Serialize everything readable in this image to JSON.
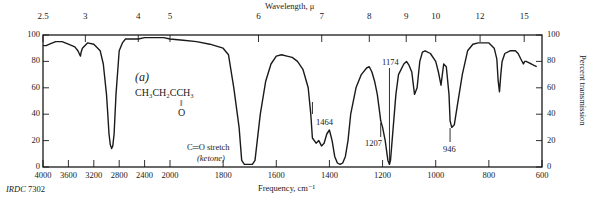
{
  "chart_data": {
    "type": "line",
    "panel_label": "(a)",
    "compound": {
      "formula_line": "CH3CH2CCH3",
      "formula_display": "CH₃CH₂CCH₃",
      "carbonyl_bond": "‖",
      "carbonyl_atom": "O"
    },
    "top_axis": {
      "label": "Wavelength, μ",
      "ticks": [
        {
          "label": "2.5",
          "wavenumber": 4000
        },
        {
          "label": "3",
          "wavenumber": 3333
        },
        {
          "label": "4",
          "wavenumber": 2500
        },
        {
          "label": "5",
          "wavenumber": 2000
        },
        {
          "label": "6",
          "wavenumber": 1667
        },
        {
          "label": "7",
          "wavenumber": 1429
        },
        {
          "label": "8",
          "wavenumber": 1250
        },
        {
          "label": "9",
          "wavenumber": 1111
        },
        {
          "label": "10",
          "wavenumber": 1000
        },
        {
          "label": "12",
          "wavenumber": 833
        },
        {
          "label": "15",
          "wavenumber": 667
        }
      ]
    },
    "xlabel": "Frequency, cm⁻¹",
    "x_ticks": [
      4000,
      3600,
      3200,
      2800,
      2400,
      2000,
      1800,
      1600,
      1400,
      1200,
      1000,
      800,
      600
    ],
    "xlim": [
      4000,
      600
    ],
    "x_scale_note": "scale expands 2x below 2000 cm-1",
    "ylabel": "Percent transmission",
    "y_ticks": [
      0,
      20,
      40,
      60,
      80,
      100
    ],
    "ylim": [
      0,
      100
    ],
    "grid": false,
    "series": [
      {
        "name": "2-butanone",
        "x": [
          4000,
          3950,
          3900,
          3800,
          3700,
          3600,
          3500,
          3450,
          3420,
          3410,
          3400,
          3380,
          3300,
          3200,
          3100,
          3050,
          3000,
          2980,
          2960,
          2940,
          2920,
          2900,
          2880,
          2850,
          2800,
          2750,
          2700,
          2600,
          2500,
          2400,
          2300,
          2200,
          2100,
          2000,
          1950,
          1900,
          1850,
          1800,
          1780,
          1760,
          1740,
          1730,
          1720,
          1710,
          1700,
          1690,
          1680,
          1660,
          1640,
          1620,
          1600,
          1580,
          1560,
          1540,
          1520,
          1500,
          1480,
          1470,
          1464,
          1450,
          1440,
          1430,
          1420,
          1410,
          1400,
          1390,
          1380,
          1370,
          1360,
          1350,
          1340,
          1330,
          1320,
          1300,
          1280,
          1260,
          1250,
          1240,
          1230,
          1220,
          1210,
          1207,
          1200,
          1190,
          1180,
          1174,
          1170,
          1160,
          1150,
          1140,
          1120,
          1110,
          1100,
          1090,
          1080,
          1070,
          1060,
          1050,
          1040,
          1020,
          1000,
          990,
          980,
          970,
          960,
          950,
          946,
          940,
          930,
          920,
          900,
          880,
          860,
          840,
          820,
          800,
          780,
          770,
          765,
          760,
          755,
          750,
          740,
          720,
          700,
          690,
          680,
          670,
          665,
          660,
          650,
          640,
          630,
          620
        ],
        "y": [
          92,
          92,
          93,
          95,
          95,
          93,
          91,
          88,
          85,
          84,
          87,
          90,
          94,
          93,
          88,
          78,
          55,
          40,
          25,
          17,
          14,
          16,
          25,
          55,
          88,
          94,
          97,
          97,
          97,
          98,
          98,
          98,
          98,
          97,
          96,
          95,
          93,
          90,
          85,
          60,
          30,
          5,
          2,
          2,
          2,
          2,
          5,
          40,
          65,
          78,
          84,
          85,
          84,
          83,
          80,
          74,
          60,
          40,
          22,
          18,
          20,
          16,
          18,
          25,
          28,
          20,
          8,
          3,
          2,
          3,
          8,
          20,
          40,
          60,
          70,
          75,
          76,
          72,
          65,
          55,
          40,
          35,
          30,
          20,
          5,
          2,
          5,
          30,
          55,
          70,
          78,
          80,
          77,
          72,
          55,
          60,
          80,
          87,
          88,
          86,
          80,
          72,
          62,
          78,
          76,
          55,
          35,
          30,
          32,
          45,
          70,
          88,
          93,
          94,
          94,
          94,
          90,
          82,
          65,
          57,
          70,
          80,
          86,
          88,
          88,
          86,
          82,
          78,
          80,
          80,
          79,
          78,
          77,
          76
        ]
      }
    ],
    "annotations": [
      {
        "text": "C=O stretch",
        "sub": "(ketone)",
        "wavenumber": 1715
      },
      {
        "text": "1464",
        "wavenumber": 1464
      },
      {
        "text": "1207",
        "wavenumber": 1207
      },
      {
        "text": "1174",
        "wavenumber": 1174
      },
      {
        "text": "946",
        "wavenumber": 946
      }
    ],
    "footer_label": "IRDC 7302",
    "colors": {
      "ink": "#1a1a1a",
      "background": "#ffffff"
    }
  },
  "labels": {
    "top_axis_title": "Wavelength, μ",
    "bottom_axis_title": "Frequency, cm⁻¹",
    "right_axis_title": "Percent transmission",
    "panel": "(a)",
    "formula": "CH₃CH₂CCH₃",
    "carbonyl_bond": "‖",
    "carbonyl_o": "O",
    "co_stretch": "C═O stretch",
    "ketone": "(ketone)",
    "peak_1464": "1464",
    "peak_1207": "1207",
    "peak_1174": "1174",
    "peak_946": "946",
    "irdc": "IRDC",
    "irdc_num": "7302"
  }
}
